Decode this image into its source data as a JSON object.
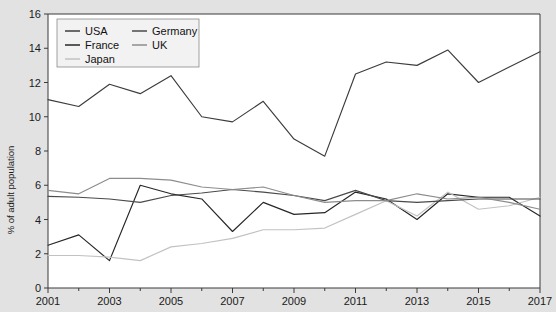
{
  "chart_data": {
    "type": "line",
    "title": "",
    "subtitle": "",
    "xlabel": "",
    "ylabel": "% of adult population",
    "xlim": [
      2001,
      2017
    ],
    "ylim": [
      0,
      16
    ],
    "ytick_step": 2,
    "xtick_step": 2,
    "grid": false,
    "legend_position": "top-left-inside",
    "x": [
      2001,
      2002,
      2003,
      2004,
      2005,
      2006,
      2007,
      2008,
      2009,
      2010,
      2011,
      2012,
      2013,
      2014,
      2015,
      2016,
      2017
    ],
    "xticklabels": [
      "2001",
      "2003",
      "2005",
      "2007",
      "2009",
      "2011",
      "2013",
      "2015",
      "2017"
    ],
    "yticklabels": [
      "0",
      "2",
      "4",
      "6",
      "8",
      "10",
      "12",
      "14",
      "16"
    ],
    "series": [
      {
        "name": "USA",
        "color": "#3c3c3c",
        "values": [
          11.0,
          10.6,
          11.9,
          11.35,
          12.4,
          10.0,
          9.7,
          10.9,
          8.7,
          7.7,
          12.5,
          13.2,
          13.0,
          13.9,
          12.0,
          12.9,
          13.8
        ]
      },
      {
        "name": "France",
        "color": "#262626",
        "values": [
          2.5,
          3.1,
          1.6,
          6.0,
          5.5,
          5.2,
          3.3,
          5.0,
          4.3,
          4.4,
          5.6,
          5.2,
          4.0,
          5.5,
          5.3,
          5.3,
          4.2
        ]
      },
      {
        "name": "Japan",
        "color": "#c2c2c2",
        "values": [
          1.9,
          1.9,
          1.8,
          1.6,
          2.4,
          2.6,
          2.9,
          3.4,
          3.4,
          3.5,
          4.3,
          5.1,
          4.2,
          5.6,
          4.6,
          4.8,
          5.3
        ]
      },
      {
        "name": "Germany",
        "color": "#4a4a4a",
        "values": [
          5.35,
          5.3,
          5.2,
          5.0,
          5.4,
          5.55,
          5.75,
          5.6,
          5.4,
          5.1,
          5.7,
          5.1,
          5.0,
          5.1,
          5.2,
          5.2,
          5.2
        ]
      },
      {
        "name": "UK",
        "color": "#8c8c8c",
        "values": [
          5.7,
          5.5,
          6.4,
          6.4,
          6.3,
          5.9,
          5.75,
          5.9,
          5.4,
          5.0,
          5.1,
          5.1,
          5.5,
          5.2,
          5.3,
          5.0,
          4.6
        ]
      }
    ],
    "legend_columns": [
      [
        "USA",
        "France",
        "Japan"
      ],
      [
        "Germany",
        "UK"
      ]
    ]
  },
  "axes": {
    "ylabel": "% of adult population"
  },
  "footnote": {
    "text": ""
  }
}
